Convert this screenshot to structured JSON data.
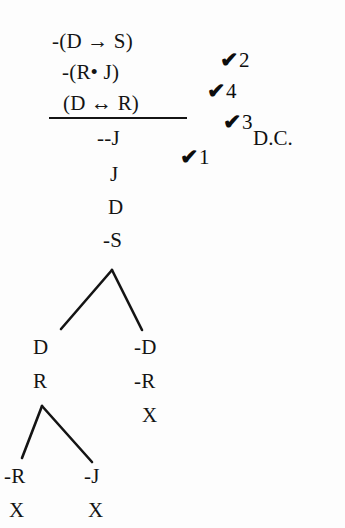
{
  "document": {
    "kind": "logic-truth-tree",
    "background_color": "#fdfdfd",
    "ink_color": "#141414"
  },
  "premises": [
    {
      "formula": "-(D → S)",
      "check": "✔",
      "number": "2"
    },
    {
      "formula": "-(R• J)",
      "check": "✔",
      "number": "4"
    },
    {
      "formula": "(D ↔ R)",
      "check": "✔",
      "number": "3"
    }
  ],
  "conclusion": {
    "formula": "--J",
    "check": "✔",
    "number": "1",
    "annotation": "D.C."
  },
  "trunk": [
    {
      "formula": "J"
    },
    {
      "formula": "D"
    },
    {
      "formula": "-S"
    }
  ],
  "branches": {
    "upper_left": [
      {
        "formula": "D"
      },
      {
        "formula": "R"
      }
    ],
    "upper_right": [
      {
        "formula": "-D"
      },
      {
        "formula": "-R"
      },
      {
        "formula": "X"
      }
    ],
    "lower_left": [
      {
        "formula": "-R"
      },
      {
        "formula": "X"
      }
    ],
    "lower_right": [
      {
        "formula": "-J"
      },
      {
        "formula": "X"
      }
    ]
  }
}
